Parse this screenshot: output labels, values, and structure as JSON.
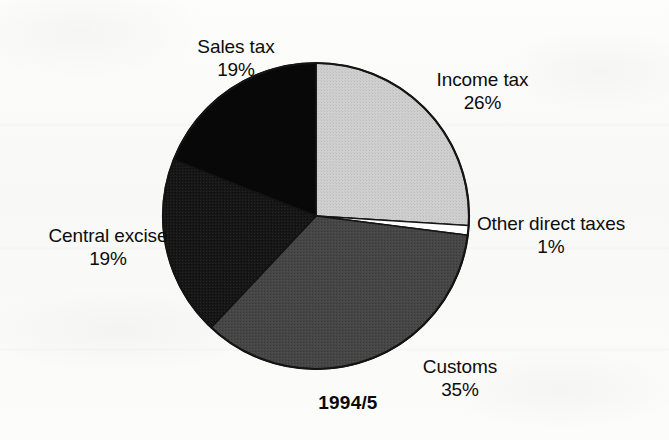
{
  "chart_data": {
    "type": "pie",
    "title": "1994/5",
    "xlabel": "",
    "ylabel": "",
    "legend_position": "none",
    "grid": false,
    "units": "percent",
    "categories": [
      "Income tax",
      "Other direct taxes",
      "Customs",
      "Central excise",
      "Sales tax"
    ],
    "values": [
      26,
      1,
      35,
      19,
      19
    ],
    "start_angle_deg": 0,
    "direction": "clockwise",
    "slices": [
      {
        "label": "Income tax",
        "value": 26,
        "value_text": "26%",
        "color": "#c9c9c9",
        "start_deg": 0,
        "end_deg": 93.6
      },
      {
        "label": "Other direct taxes",
        "value": 1,
        "value_text": "1%",
        "color": "#fdfdfd",
        "start_deg": 93.6,
        "end_deg": 97.2
      },
      {
        "label": "Customs",
        "value": 35,
        "value_text": "35%",
        "color": "#454545",
        "start_deg": 97.2,
        "end_deg": 223.2
      },
      {
        "label": "Central excise",
        "value": 19,
        "value_text": "19%",
        "color": "#1b1b1b",
        "start_deg": 223.2,
        "end_deg": 291.6
      },
      {
        "label": "Sales tax",
        "value": 19,
        "value_text": "19%",
        "color": "#080808",
        "start_deg": 291.6,
        "end_deg": 360
      }
    ]
  },
  "labels": {
    "sales_tax": {
      "name": "Sales tax",
      "pct": "19%"
    },
    "income_tax": {
      "name": "Income tax",
      "pct": "26%"
    },
    "other_direct": {
      "name": "Other direct taxes",
      "pct": "1%"
    },
    "customs": {
      "name": "Customs",
      "pct": "35%"
    },
    "central_excise": {
      "name": "Central excise",
      "pct": "19%"
    }
  },
  "title": "1994/5",
  "colors": {
    "income_tax": "#c9c9c9",
    "other_direct_taxes": "#fdfdfd",
    "customs": "#454545",
    "central_excise": "#1b1b1b",
    "sales_tax": "#080808",
    "outline": "#111111",
    "text": "#0d0d0d",
    "background": "#fbfbfa"
  }
}
